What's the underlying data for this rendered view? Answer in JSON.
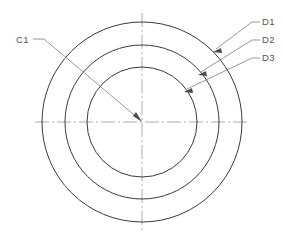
{
  "drawing": {
    "type": "cad-technical-drawing",
    "title": "Concentric circles with diameter callouts",
    "background_color": "#ffffff",
    "line_color": "#3a3a3a",
    "centerline_color": "#9a9a9a",
    "leader_color": "#7d7d7d",
    "text_color": "#555555",
    "canvas": {
      "width": 283,
      "height": 243
    },
    "center": {
      "x": 142,
      "y": 122
    },
    "circles": [
      {
        "id": "D1",
        "radius": 100,
        "role": "outer-circle"
      },
      {
        "id": "D2",
        "radius": 77,
        "role": "middle-circle"
      },
      {
        "id": "D3",
        "radius": 55,
        "role": "inner-circle"
      }
    ],
    "centerlines": [
      {
        "id": "horizontal-centerline",
        "x1": 35,
        "y1": 122,
        "x2": 249,
        "y2": 122
      },
      {
        "id": "vertical-centerline",
        "x1": 142,
        "y1": 13,
        "x2": 142,
        "y2": 231
      }
    ],
    "callouts": [
      {
        "id": "C1",
        "label": "C1",
        "text_x": 16,
        "text_y": 43,
        "stub": {
          "x1": 33,
          "y1": 39,
          "x2": 44,
          "y2": 39
        },
        "leader": {
          "x1": 44,
          "y1": 39,
          "x2": 140,
          "y2": 120
        },
        "arrow_at": {
          "x": 141,
          "y": 121
        },
        "points_to": "center"
      },
      {
        "id": "D1",
        "label": "D1",
        "text_x": 262,
        "text_y": 25,
        "stub": {
          "x1": 252,
          "y1": 22,
          "x2": 260,
          "y2": 22
        },
        "leader": {
          "x1": 252,
          "y1": 22,
          "x2": 215,
          "y2": 50
        },
        "arrow_at": {
          "x": 214,
          "y": 51
        },
        "points_to": "outer-circle"
      },
      {
        "id": "D2",
        "label": "D2",
        "text_x": 262,
        "text_y": 43,
        "stub": {
          "x1": 252,
          "y1": 40,
          "x2": 260,
          "y2": 40
        },
        "leader": {
          "x1": 252,
          "y1": 40,
          "x2": 200,
          "y2": 73
        },
        "arrow_at": {
          "x": 199,
          "y": 74
        },
        "points_to": "middle-circle"
      },
      {
        "id": "D3",
        "label": "D3",
        "text_x": 262,
        "text_y": 61,
        "stub": {
          "x1": 252,
          "y1": 58,
          "x2": 260,
          "y2": 58
        },
        "leader": {
          "x1": 252,
          "y1": 58,
          "x2": 186,
          "y2": 90
        },
        "arrow_at": {
          "x": 185,
          "y": 91
        },
        "points_to": "inner-circle"
      }
    ]
  }
}
